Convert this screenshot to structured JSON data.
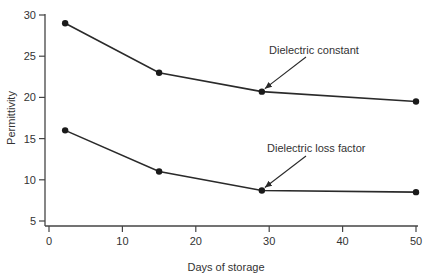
{
  "chart_data": {
    "type": "line",
    "title": "",
    "xlabel": "Days of storage",
    "ylabel": "Permittivity",
    "xlim": [
      0,
      50
    ],
    "ylim": [
      5,
      30
    ],
    "xticks": [
      0,
      10,
      20,
      30,
      40,
      50
    ],
    "yticks": [
      5,
      10,
      15,
      20,
      25,
      30
    ],
    "grid": false,
    "legend": "none (inline annotations with arrows)",
    "series": [
      {
        "name": "Dielectric constant",
        "x": [
          2.2,
          15,
          29,
          50
        ],
        "y": [
          29,
          23,
          20.7,
          19.5
        ]
      },
      {
        "name": "Dielectric loss factor",
        "x": [
          2.2,
          15,
          29,
          50
        ],
        "y": [
          16,
          11,
          8.7,
          8.5
        ]
      }
    ],
    "annotations": [
      {
        "text": "Dielectric constant",
        "points_to": [
          29,
          20.7
        ]
      },
      {
        "text": "Dielectric loss factor",
        "points_to": [
          29,
          8.7
        ]
      }
    ]
  },
  "labels": {
    "xlabel": "Days of storage",
    "ylabel": "Permittivity",
    "annot_constant": "Dielectric constant",
    "annot_loss": "Dielectric loss factor"
  },
  "colors": {
    "line": "#2a2a2a",
    "axis": "#444444",
    "text": "#333333"
  }
}
